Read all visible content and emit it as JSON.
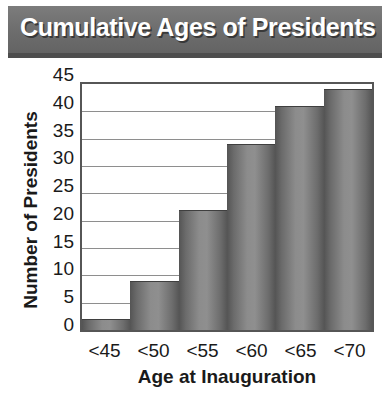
{
  "chart_data": {
    "type": "bar",
    "title": "Cumulative Ages of Presidents",
    "xlabel": "Age at Inauguration",
    "ylabel": "Number of Presidents",
    "categories": [
      "<45",
      "<50",
      "<55",
      "<60",
      "<65",
      "<70"
    ],
    "values": [
      2,
      9,
      22,
      34,
      41,
      44
    ],
    "ylim": [
      0,
      45
    ],
    "ytick_labels": [
      "0",
      "5",
      "10",
      "15",
      "20",
      "25",
      "30",
      "35",
      "40",
      "45"
    ],
    "ytick_values": [
      0,
      5,
      10,
      15,
      20,
      25,
      30,
      35,
      40,
      45
    ],
    "grid": true,
    "legend": false,
    "bar_color": "#808080",
    "title_bar_color": "#6e6e6e",
    "title_text_color": "#ffffff",
    "axis_color": "#565656",
    "gridline_color": "#8e8e8e"
  }
}
